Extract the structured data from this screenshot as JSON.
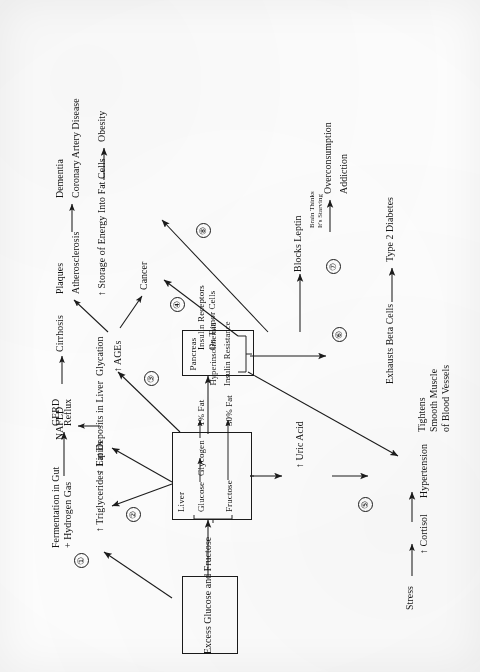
{
  "diagram": {
    "ink_color": "#1b1b1b",
    "background_color": "#fefefe",
    "orientation": "rotated-90-ccw",
    "boxes": [
      {
        "id": "source",
        "lines": [
          "Excess Glucose and Fructose"
        ]
      },
      {
        "id": "liver",
        "label": "Liver",
        "rows": [
          {
            "from": "Glucose",
            "to": "Glycogen",
            "result": "1% Fat"
          },
          {
            "from": "Fructose",
            "to": "",
            "result": "30% Fat"
          }
        ],
        "bracket": true
      },
      {
        "id": "pancreas",
        "lines": [
          "Pancreas",
          "Hyperinsolinemia",
          "Insulin Resistance"
        ],
        "bracket": true
      }
    ],
    "markers": [
      {
        "num": "1",
        "glyph": "①"
      },
      {
        "num": "2",
        "glyph": "②"
      },
      {
        "num": "3",
        "glyph": "③"
      },
      {
        "num": "4",
        "glyph": "④"
      },
      {
        "num": "5",
        "glyph": "⑤"
      },
      {
        "num": "6",
        "glyph": "⑥"
      },
      {
        "num": "7",
        "glyph": "⑦"
      },
      {
        "num": "8",
        "glyph": "⑧"
      }
    ],
    "nodes": {
      "fermentation": "Fermentation in Gut",
      "hydrogen": "+ Hydrogen Gas",
      "gerd": "GERD",
      "reflux": "Reflux",
      "triglycerides": "↑ Triglycerides",
      "lipids": "↑ Lipids",
      "fat_deposits": "Fat Deposits in Liver",
      "nafld": "NAFLD",
      "cirrhosis": "Cirrhosis",
      "glycation": "Glycation",
      "ages": "↑ AGEs",
      "plaques": "Plaques",
      "atherosclerosis": "Atherosclerosis",
      "dementia": "Dementia",
      "coronary": "Coronary Artery Disease",
      "cancer": "Cancer",
      "insulin_rec_1": "Insulin Receptors",
      "insulin_rec_2": "On Tumor Cells",
      "storage": "↑ Storage of Energy Into Fat Cells",
      "obesity": "Obesity",
      "blocks_leptin": "Blocks Leptin",
      "brain_1": "Brain Thinks",
      "brain_2": "It's Starving",
      "overconsumption": "Overconsumption",
      "addiction": "Addiction",
      "exhausts": "Exhausts Beta Cells",
      "type2": "Type 2 Diabetes",
      "tightens_1": "Tightens",
      "tightens_2": "Smooth Muscle",
      "tightens_3": "of Blood Vessels",
      "uric_acid": "↑ Uric Acid",
      "hypertension": "Hypertension",
      "stress": "Stress",
      "cortisol": "↑ Cortisol",
      "liver_label": "Liver",
      "glucose": "Glucose",
      "fructose": "Fructose",
      "glycogen": "Glycogen",
      "fat1": "1% Fat",
      "fat30": "30% Fat",
      "pancreas": "Pancreas",
      "hyperinsolinemia": "Hyperinsolinemia",
      "insulin_resistance": "Insulin Resistance",
      "source_box": "Excess Glucose and Fructose",
      "arrow_right": "→"
    }
  }
}
